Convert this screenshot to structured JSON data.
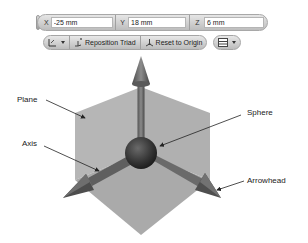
{
  "toolbar": {
    "coords": [
      {
        "axis": "X",
        "value": "-25 mm"
      },
      {
        "axis": "Y",
        "value": "18 mm"
      },
      {
        "axis": "Z",
        "value": "6 mm"
      }
    ],
    "buttons": {
      "triad_options": "triad-options-dropdown",
      "reposition": "Reposition Triad",
      "reset": "Reset to Origin",
      "view_options": "view-options-dropdown"
    }
  },
  "diagram": {
    "labels": {
      "plane": "Plane",
      "axis": "Axis",
      "sphere": "Sphere",
      "arrowhead": "Arrowhead"
    },
    "colors": {
      "plane": "#b3b3b3",
      "plane_dark": "#a3a3a3",
      "arrow": "#6a6a6a",
      "sphere": "#3a3a3a"
    }
  }
}
